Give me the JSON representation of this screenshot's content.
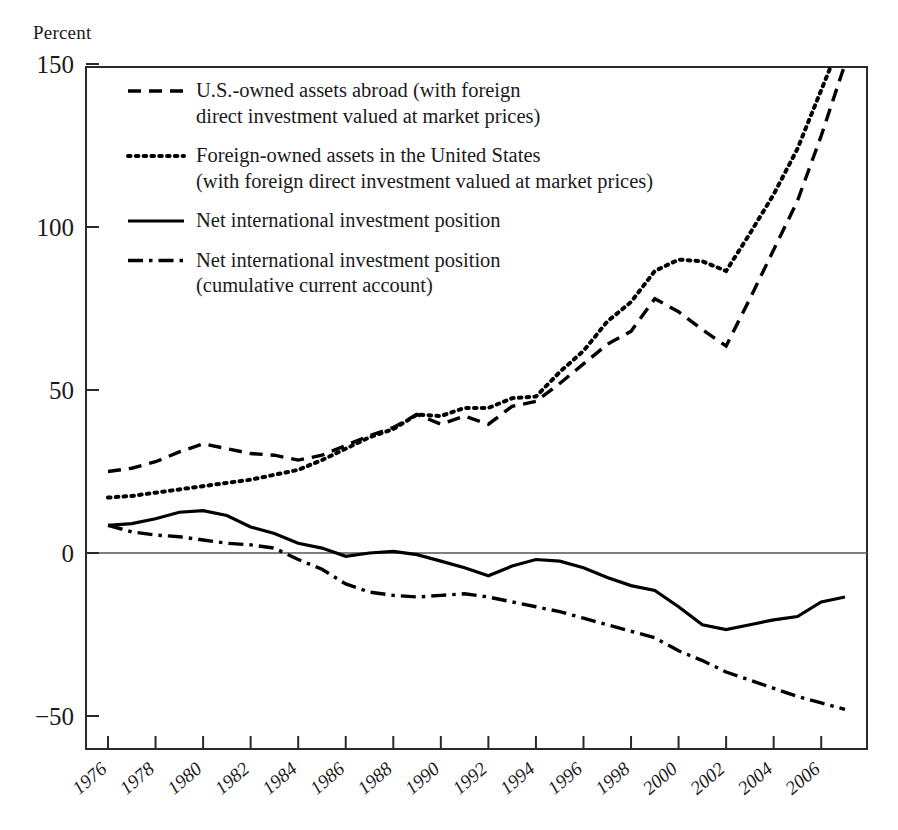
{
  "figure": {
    "y_axis_unit_label": "Percent"
  },
  "legend": {
    "items": [
      {
        "id": "us-owned-assets-abroad",
        "style": "dashed",
        "lines": [
          "U.S.-owned assets abroad (with foreign",
          "direct investment valued at market prices)"
        ]
      },
      {
        "id": "foreign-owned-assets-in-us",
        "style": "dotted",
        "lines": [
          "Foreign-owned assets in the United States",
          "(with foreign direct investment valued at market prices)"
        ]
      },
      {
        "id": "net-international-investment-position",
        "style": "solid",
        "lines": [
          "Net international investment position"
        ]
      },
      {
        "id": "net-iip-cumulative-current-account",
        "style": "dashdot",
        "lines": [
          "Net international investment position",
          "(cumulative current account)"
        ]
      }
    ]
  },
  "chart_data": {
    "type": "line",
    "title": "",
    "subtitle": "",
    "xlabel": "",
    "ylabel": "Percent",
    "xlim": [
      1976,
      2007
    ],
    "ylim": [
      -65,
      165
    ],
    "grid": false,
    "legend_position": "inside-top-left",
    "y_ticks": [
      -50,
      0,
      50,
      100,
      150
    ],
    "y_tick_labels": [
      "−50",
      "0",
      "50",
      "100",
      "150"
    ],
    "x_ticks": [
      1976,
      1978,
      1980,
      1982,
      1984,
      1986,
      1988,
      1990,
      1992,
      1994,
      1996,
      1998,
      2000,
      2002,
      2004,
      2006
    ],
    "x_tick_labels": [
      "1976",
      "1978",
      "1980",
      "1982",
      "1984",
      "1986",
      "1988",
      "1990",
      "1992",
      "1994",
      "1996",
      "1998",
      "2000",
      "2002",
      "2004",
      "2006"
    ],
    "x": [
      1976,
      1977,
      1978,
      1979,
      1980,
      1981,
      1982,
      1983,
      1984,
      1985,
      1986,
      1987,
      1988,
      1989,
      1990,
      1991,
      1992,
      1993,
      1994,
      1995,
      1996,
      1997,
      1998,
      1999,
      2000,
      2001,
      2002,
      2003,
      2004,
      2005,
      2006,
      2007
    ],
    "series": [
      {
        "name": "U.S.-owned assets abroad (with foreign direct investment valued at market prices)",
        "style": "dashed",
        "color": "#000000",
        "values": [
          25,
          26,
          28,
          31,
          33.5,
          32,
          30.5,
          30,
          28.5,
          30,
          33,
          36,
          38.5,
          42.5,
          39.5,
          42,
          39.5,
          45,
          46.5,
          52,
          58,
          64,
          68,
          78,
          74,
          68.5,
          63.5,
          78,
          93,
          108,
          128,
          150
        ]
      },
      {
        "name": "Foreign-owned assets in the United States (with foreign direct investment valued at market prices)",
        "style": "dotted",
        "color": "#000000",
        "values": [
          17,
          17.5,
          18.5,
          19.5,
          20.5,
          21.5,
          22.5,
          24,
          25.5,
          28.5,
          32,
          35.5,
          38,
          42.5,
          42,
          44.5,
          44.5,
          47.5,
          48,
          55.5,
          62,
          71,
          77,
          86.5,
          90,
          89.5,
          86.5,
          98,
          110,
          124,
          142,
          160
        ]
      },
      {
        "name": "Net international investment position",
        "style": "solid",
        "color": "#000000",
        "values": [
          8.5,
          9,
          10.5,
          12.5,
          13,
          11.5,
          8,
          6,
          3,
          1.5,
          -1,
          0,
          0.5,
          -0.5,
          -2.5,
          -4.5,
          -7,
          -4,
          -2,
          -2.5,
          -4.5,
          -7.5,
          -10,
          -11.5,
          -16.5,
          -22,
          -23.5,
          -22,
          -20.5,
          -19.5,
          -15,
          -13.5
        ]
      },
      {
        "name": "Net international investment position (cumulative current account)",
        "style": "dashdot",
        "color": "#000000",
        "values": [
          8.5,
          6.5,
          5.5,
          5,
          4,
          3,
          2.5,
          1.5,
          -2,
          -5,
          -9.5,
          -12,
          -13,
          -13.5,
          -13,
          -12.5,
          -13.5,
          -15,
          -16.5,
          -18,
          -20,
          -22,
          -24,
          -26,
          -30,
          -33,
          -36.5,
          -39,
          -41.5,
          -44,
          -46,
          -48
        ]
      }
    ]
  }
}
